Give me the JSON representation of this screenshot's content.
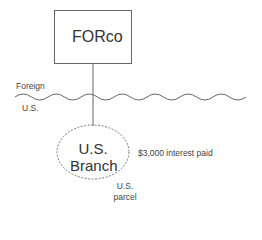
{
  "diagram": {
    "parent_entity": {
      "label": "FORco",
      "shape": "rectangle"
    },
    "border": {
      "above_label": "Foreign",
      "below_label": "U.S.",
      "shape": "wavy-line"
    },
    "branch": {
      "line1": "U.S.",
      "line2": "Branch",
      "shape": "dashed-ellipse"
    },
    "payment_label": "$3,000 interest paid",
    "parcel_label": {
      "line1": "U.S.",
      "line2": "parcel"
    },
    "colors": {
      "stroke": "#666666",
      "text": "#333333",
      "background": "#ffffff"
    }
  }
}
